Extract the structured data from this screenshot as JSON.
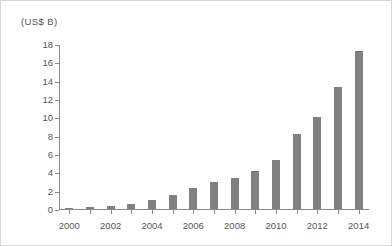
{
  "chart_data": {
    "type": "bar",
    "title": "",
    "subtitle": "",
    "unit_label": "(US$ B)",
    "xlabel": "",
    "ylabel": "",
    "categories": [
      "2000",
      "2001",
      "2002",
      "2003",
      "2004",
      "2005",
      "2006",
      "2007",
      "2008",
      "2009",
      "2010",
      "2011",
      "2012",
      "2013",
      "2014"
    ],
    "values": [
      0.1,
      0.25,
      0.35,
      0.6,
      1.0,
      1.5,
      2.3,
      3.0,
      3.4,
      4.1,
      5.4,
      8.2,
      10.0,
      13.3,
      17.2
    ],
    "series": [
      {
        "name": "value",
        "values": [
          0.1,
          0.25,
          0.35,
          0.6,
          1.0,
          1.5,
          2.3,
          3.0,
          3.4,
          4.1,
          5.4,
          8.2,
          10.0,
          13.3,
          17.2
        ]
      }
    ],
    "ylim": [
      0,
      18
    ],
    "yticks": [
      0,
      2,
      4,
      6,
      8,
      10,
      12,
      14,
      16,
      18
    ],
    "ytick_labels": [
      "0",
      "2",
      "4",
      "6",
      "8",
      "10",
      "12",
      "14",
      "16",
      "18"
    ],
    "xtick_labels": [
      "2000",
      "2002",
      "2004",
      "2006",
      "2008",
      "2010",
      "2012",
      "2014"
    ],
    "xtick_categories": [
      "2000",
      "2002",
      "2004",
      "2006",
      "2008",
      "2010",
      "2012",
      "2014"
    ],
    "grid": false,
    "legend": null,
    "legend_position": "none",
    "bar_color": "#808080",
    "axis_color": "#8a8a8a",
    "text_color": "#555555",
    "background_color": "#ffffff",
    "border_color": "#d8d8d8",
    "annotations": []
  }
}
